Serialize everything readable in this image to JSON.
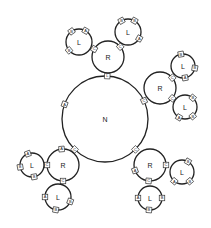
{
  "diagram": {
    "title": "",
    "nodes": [
      {
        "id": "N",
        "label": "N",
        "cx": 105,
        "cy": 119,
        "r": 43,
        "ports": [
          {
            "label": "L",
            "angle": -87
          },
          {
            "label": "A",
            "angle": 200
          },
          {
            "label": "C",
            "angle": -25
          },
          {
            "label": "C",
            "angle": 135
          },
          {
            "label": "C",
            "angle": 45
          }
        ]
      },
      {
        "id": "R1",
        "label": "R",
        "cx": 108,
        "cy": 57,
        "r": 16,
        "ports": [
          {
            "label": "C",
            "angle": -150
          },
          {
            "label": "C",
            "angle": -40
          }
        ]
      },
      {
        "id": "L1",
        "label": "L",
        "cx": 79,
        "cy": 42,
        "r": 13,
        "ports": [
          {
            "label": "B",
            "angle": -125
          },
          {
            "label": "A",
            "angle": -60
          },
          {
            "label": "B",
            "angle": 140
          }
        ]
      },
      {
        "id": "L2",
        "label": "L",
        "cx": 128,
        "cy": 32,
        "r": 13,
        "ports": [
          {
            "label": "B",
            "angle": -120
          },
          {
            "label": "B",
            "angle": -60
          },
          {
            "label": "A",
            "angle": 30
          }
        ]
      },
      {
        "id": "R2",
        "label": "R",
        "cx": 160,
        "cy": 88,
        "r": 16,
        "ports": [
          {
            "label": "C",
            "angle": -40
          },
          {
            "label": "C",
            "angle": 40
          }
        ]
      },
      {
        "id": "L3",
        "label": "L",
        "cx": 183,
        "cy": 66,
        "r": 12,
        "ports": [
          {
            "label": "B",
            "angle": -100
          },
          {
            "label": "B",
            "angle": 10
          },
          {
            "label": "A",
            "angle": 80
          }
        ]
      },
      {
        "id": "L4",
        "label": "L",
        "cx": 185,
        "cy": 107,
        "r": 12,
        "ports": [
          {
            "label": "B",
            "angle": -50
          },
          {
            "label": "B",
            "angle": 50
          },
          {
            "label": "A",
            "angle": 120
          }
        ]
      },
      {
        "id": "R3",
        "label": "R",
        "cx": 63,
        "cy": 165,
        "r": 16,
        "ports": [
          {
            "label": "A",
            "angle": -95
          },
          {
            "label": "C",
            "angle": 180
          },
          {
            "label": "C",
            "angle": 90
          }
        ]
      },
      {
        "id": "L5",
        "label": "L",
        "cx": 32,
        "cy": 165,
        "r": 12,
        "ports": [
          {
            "label": "A",
            "angle": -110
          },
          {
            "label": "B",
            "angle": 170
          },
          {
            "label": "B",
            "angle": 80
          }
        ]
      },
      {
        "id": "L6",
        "label": "L",
        "cx": 58,
        "cy": 197,
        "r": 13,
        "ports": [
          {
            "label": "A",
            "angle": 180
          },
          {
            "label": "B",
            "angle": 100
          },
          {
            "label": "B",
            "angle": 20
          }
        ]
      },
      {
        "id": "R4",
        "label": "R",
        "cx": 150,
        "cy": 165,
        "r": 16,
        "ports": [
          {
            "label": "A",
            "angle": 160
          },
          {
            "label": "C",
            "angle": 0
          },
          {
            "label": "C",
            "angle": 95
          }
        ]
      },
      {
        "id": "L7",
        "label": "L",
        "cx": 182,
        "cy": 172,
        "r": 12,
        "ports": [
          {
            "label": "B",
            "angle": -60
          },
          {
            "label": "B",
            "angle": 50
          },
          {
            "label": "A",
            "angle": 130
          }
        ]
      },
      {
        "id": "L8",
        "label": "L",
        "cx": 150,
        "cy": 198,
        "r": 12,
        "ports": [
          {
            "label": "A",
            "angle": 180
          },
          {
            "label": "B",
            "angle": 0
          },
          {
            "label": "B",
            "angle": 95
          }
        ]
      }
    ]
  }
}
